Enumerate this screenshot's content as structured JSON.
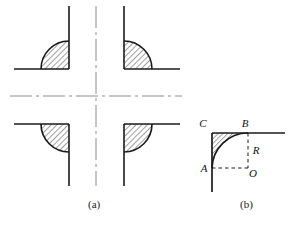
{
  "figure": {
    "background_color": "#ffffff",
    "line_color": "#1a1a1a",
    "centerline_color": "#8c8c8c",
    "hatch_color": "#2b2b2b",
    "width": 297,
    "height": 227,
    "panels": [
      {
        "id": "a",
        "caption": "(a)",
        "description": "Four mirrored fillet corners arranged around dash-dot center lines",
        "center": {
          "x": 96,
          "y": 96
        },
        "fillet_radius": 28,
        "quadrants": [
          {
            "name": "top-left",
            "corner_x": 69,
            "corner_y": 69,
            "arm_h_from": 14,
            "arm_v_to": 6
          },
          {
            "name": "top-right",
            "corner_x": 124,
            "corner_y": 69,
            "arm_h_to": 180,
            "arm_v_to": 6
          },
          {
            "name": "bottom-left",
            "corner_x": 69,
            "corner_y": 124,
            "arm_h_from": 14,
            "arm_v_to": 186
          },
          {
            "name": "bottom-right",
            "corner_x": 124,
            "corner_y": 124,
            "arm_h_to": 180,
            "arm_v_to": 186
          }
        ],
        "centerlines": {
          "vertical": {
            "x": 96,
            "from_y": 6,
            "to_y": 186
          },
          "horizontal": {
            "y": 96,
            "from_x": 10,
            "to_x": 182
          },
          "dash_pattern": "dash-dot"
        }
      },
      {
        "id": "b",
        "caption": "(b)",
        "description": "Single fillet corner with construction lines showing radius R, arc from A to B, center O, corner C",
        "corner": {
          "x": 212,
          "y": 133
        },
        "center_O": {
          "x": 248,
          "y": 168
        },
        "radius": 36,
        "points": [
          {
            "label": "C",
            "x": 205,
            "y": 127,
            "role": "sharp-corner-apex"
          },
          {
            "label": "B",
            "x": 245,
            "y": 127,
            "role": "arc-tangent-top"
          },
          {
            "label": "R",
            "x": 253,
            "y": 152,
            "role": "radius-dimension"
          },
          {
            "label": "A",
            "x": 203,
            "y": 170,
            "role": "arc-tangent-left"
          },
          {
            "label": "O",
            "x": 252,
            "y": 174,
            "role": "arc-center"
          }
        ],
        "solid_lines": [
          {
            "name": "horizontal-arm",
            "from_x": 212,
            "from_y": 133,
            "to_x": 285,
            "to_y": 133
          },
          {
            "name": "vertical-arm",
            "from_x": 212,
            "from_y": 133,
            "to_x": 212,
            "to_y": 192
          }
        ],
        "dashed_lines": [
          {
            "name": "radius-vertical-B-to-O",
            "from_x": 248,
            "from_y": 133,
            "to_x": 248,
            "to_y": 168
          },
          {
            "name": "radius-horizontal-A-to-O",
            "from_x": 212,
            "from_y": 168,
            "to_x": 248,
            "to_y": 168
          }
        ]
      }
    ]
  }
}
